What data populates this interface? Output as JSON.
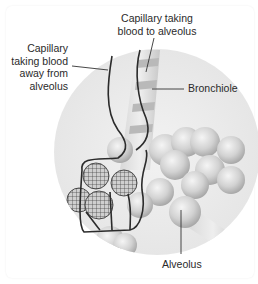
{
  "diagram": {
    "type": "anatomical-illustration",
    "labels": {
      "capillary_away": "Capillary taking blood away from alveolus",
      "capillary_away_lines": [
        "Capillary",
        "taking blood",
        "away from",
        "alveolus"
      ],
      "capillary_to_lines": [
        "Capillary taking",
        "blood to alveolus"
      ],
      "bronchiole": "Bronchiole",
      "alveolus": "Alveolus"
    },
    "colors": {
      "background_circle": "#ececec",
      "alveolus_fill": "#d4d4d4",
      "capillary_line": "#2b2b2b",
      "text": "#2a2a2a"
    }
  }
}
